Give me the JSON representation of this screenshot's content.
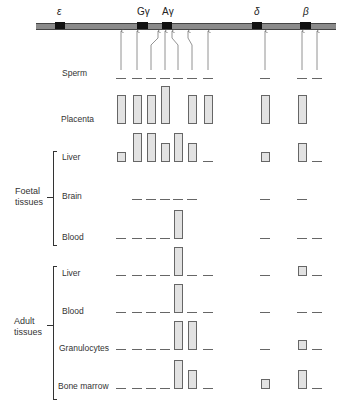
{
  "genes": [
    {
      "name": "epsilon",
      "label": "ε",
      "x": 55,
      "w": 10
    },
    {
      "name": "G-gamma",
      "label": "Gγ",
      "x": 137,
      "w": 11
    },
    {
      "name": "A-gamma",
      "label": "Aγ",
      "x": 162,
      "w": 10
    },
    {
      "name": "delta",
      "label": "δ",
      "x": 252,
      "w": 10
    },
    {
      "name": "beta",
      "label": "β",
      "x": 300,
      "w": 11
    }
  ],
  "groups": {
    "foetal": "Foetal\ntissues",
    "adult": "Adult\ntissues"
  },
  "chart_data": {
    "type": "bar",
    "gene_labels": [
      "ε",
      "Gγ",
      "Aγ",
      "δ",
      "β"
    ],
    "columns": [
      1,
      2,
      3,
      4,
      5,
      6,
      7,
      8,
      9,
      10
    ],
    "legend_note": "Bar = hypersensitive site present (height ~ relative strength); dash = absent; blank = not determined",
    "rows": [
      {
        "label": "Sperm",
        "group": "",
        "values": [
          0,
          0,
          0,
          0,
          0,
          0,
          0,
          0,
          0,
          0
        ]
      },
      {
        "label": "Placenta",
        "group": "",
        "values": [
          3,
          3,
          3,
          4,
          null,
          3,
          3,
          3,
          3,
          null
        ]
      },
      {
        "label": "Liver",
        "group": "Foetal tissues",
        "values": [
          1,
          3,
          3,
          2,
          3,
          2,
          0,
          1,
          2,
          0
        ]
      },
      {
        "label": "Brain",
        "group": "Foetal tissues",
        "values": [
          null,
          0,
          0,
          0,
          0,
          0,
          null,
          0,
          0,
          null
        ]
      },
      {
        "label": "Blood",
        "group": "Foetal tissues",
        "values": [
          0,
          0,
          0,
          0,
          3,
          null,
          null,
          0,
          0,
          0
        ]
      },
      {
        "label": "Liver",
        "group": "Adult tissues",
        "values": [
          0,
          0,
          0,
          0,
          3,
          0,
          0,
          0,
          1,
          0
        ]
      },
      {
        "label": "Blood",
        "group": "Adult tissues",
        "values": [
          0,
          0,
          0,
          0,
          3,
          0,
          0,
          0,
          0,
          0
        ]
      },
      {
        "label": "Granulocytes",
        "group": "Adult tissues",
        "values": [
          0,
          0,
          0,
          0,
          3,
          3,
          0,
          0,
          1,
          0
        ]
      },
      {
        "label": "Bone marrow",
        "group": "Adult tissues",
        "values": [
          0,
          0,
          0,
          0,
          3,
          2,
          0,
          1,
          2,
          0
        ]
      }
    ]
  }
}
